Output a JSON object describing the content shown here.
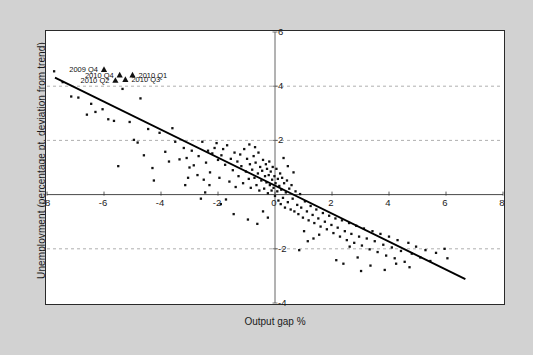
{
  "chart_data": {
    "type": "scatter",
    "title": "",
    "xlabel": "Output gap %",
    "ylabel": "Unemployment (percentage pt. deviation from trend)",
    "xlim": [
      -8,
      8
    ],
    "ylim": [
      -4,
      6
    ],
    "xticks": [
      "-8",
      "-6",
      "-4",
      "-2",
      "0",
      "2",
      "4",
      "6",
      "8"
    ],
    "xtick_values": [
      -8,
      -6,
      -4,
      -2,
      0,
      2,
      4,
      6,
      8
    ],
    "yticks": [
      "6",
      "4",
      "2",
      "-2",
      "-4"
    ],
    "ytick_values": [
      6,
      4,
      2,
      -2,
      -4
    ],
    "grid": "horizontal dashed at y = 4, 2, -2; solid axes at x = 0 and y = 0",
    "gridlines_y": [
      4,
      2,
      -2
    ],
    "axis_lines": {
      "x_zero": 0,
      "y_zero": 0
    },
    "legend": "none",
    "marker_style": "small black square",
    "fit_line": {
      "label": "linear trend line",
      "x1": -7.72,
      "y1": 4.32,
      "x2": 6.68,
      "y2": -3.12,
      "color": "#000000"
    },
    "points": [
      [
        -7.75,
        4.55
      ],
      [
        -7.45,
        4.15
      ],
      [
        -7.15,
        3.62
      ],
      [
        -6.9,
        3.58
      ],
      [
        -6.45,
        3.35
      ],
      [
        -6.3,
        3.05
      ],
      [
        -6.05,
        3.15
      ],
      [
        -5.85,
        2.78
      ],
      [
        -5.65,
        2.72
      ],
      [
        -5.35,
        3.9
      ],
      [
        -5.1,
        2.68
      ],
      [
        -4.95,
        2.02
      ],
      [
        -4.82,
        1.92
      ],
      [
        -4.72,
        3.55
      ],
      [
        -4.6,
        1.45
      ],
      [
        -4.45,
        2.42
      ],
      [
        -4.3,
        0.98
      ],
      [
        -4.05,
        2.28
      ],
      [
        -3.85,
        1.58
      ],
      [
        -3.72,
        1.22
      ],
      [
        -3.6,
        2.45
      ],
      [
        -3.5,
        1.95
      ],
      [
        -3.35,
        1.3
      ],
      [
        -3.2,
        1.72
      ],
      [
        -3.1,
        1.35
      ],
      [
        -3.0,
        1.0
      ],
      [
        -2.92,
        1.62
      ],
      [
        -2.85,
        1.08
      ],
      [
        -2.72,
        0.72
      ],
      [
        -2.68,
        1.42
      ],
      [
        -2.55,
        1.95
      ],
      [
        -2.5,
        0.55
      ],
      [
        -2.42,
        1.18
      ],
      [
        -2.35,
        1.62
      ],
      [
        -2.28,
        0.82
      ],
      [
        -2.2,
        1.52
      ],
      [
        -2.12,
        1.72
      ],
      [
        -2.05,
        1.9
      ],
      [
        -2.0,
        1.28
      ],
      [
        -1.95,
        0.62
      ],
      [
        -1.88,
        1.45
      ],
      [
        -1.82,
        1.68
      ],
      [
        -1.75,
        1.1
      ],
      [
        -1.68,
        1.82
      ],
      [
        -1.6,
        0.48
      ],
      [
        -1.55,
        1.32
      ],
      [
        -1.48,
        0.9
      ],
      [
        -1.42,
        1.55
      ],
      [
        -1.38,
        0.28
      ],
      [
        -1.32,
        1.22
      ],
      [
        -1.28,
        0.68
      ],
      [
        -1.22,
        1.48
      ],
      [
        -1.18,
        1.05
      ],
      [
        -1.12,
        0.42
      ],
      [
        -1.08,
        1.68
      ],
      [
        -1.02,
        0.85
      ],
      [
        -0.98,
        1.32
      ],
      [
        -0.92,
        0.58
      ],
      [
        -0.88,
        1.12
      ],
      [
        -0.85,
        0.25
      ],
      [
        -0.8,
        0.92
      ],
      [
        -0.75,
        1.42
      ],
      [
        -0.72,
        0.62
      ],
      [
        -0.68,
        1.18
      ],
      [
        -0.65,
        0.35
      ],
      [
        -0.6,
        0.78
      ],
      [
        -0.58,
        1.55
      ],
      [
        -0.55,
        0.15
      ],
      [
        -0.52,
        1.02
      ],
      [
        -0.48,
        0.52
      ],
      [
        -0.45,
        0.88
      ],
      [
        -0.42,
        1.28
      ],
      [
        -0.38,
        0.22
      ],
      [
        -0.35,
        0.68
      ],
      [
        -0.32,
        1.12
      ],
      [
        -0.3,
        0.45
      ],
      [
        -0.28,
        0.95
      ],
      [
        -0.25,
        0.05
      ],
      [
        -0.22,
        0.72
      ],
      [
        -0.2,
        1.22
      ],
      [
        -0.18,
        0.35
      ],
      [
        -0.15,
        0.85
      ],
      [
        -0.12,
        0.15
      ],
      [
        -0.1,
        0.55
      ],
      [
        -0.08,
        1.02
      ],
      [
        -0.05,
        0.25
      ],
      [
        -0.02,
        0.68
      ],
      [
        0.0,
        -0.05
      ],
      [
        0.02,
        0.42
      ],
      [
        0.05,
        0.95
      ],
      [
        0.08,
        0.12
      ],
      [
        0.1,
        0.58
      ],
      [
        0.12,
        -0.22
      ],
      [
        0.15,
        0.32
      ],
      [
        0.18,
        0.78
      ],
      [
        0.2,
        -0.35
      ],
      [
        0.22,
        0.18
      ],
      [
        0.25,
        0.62
      ],
      [
        0.28,
        -0.12
      ],
      [
        0.32,
        0.42
      ],
      [
        0.35,
        -0.48
      ],
      [
        0.38,
        0.08
      ],
      [
        0.42,
        0.52
      ],
      [
        0.45,
        -0.28
      ],
      [
        0.5,
        0.22
      ],
      [
        0.55,
        -0.55
      ],
      [
        0.58,
        0.35
      ],
      [
        0.62,
        -0.15
      ],
      [
        0.68,
        -0.62
      ],
      [
        0.72,
        0.12
      ],
      [
        0.78,
        -0.38
      ],
      [
        0.82,
        -0.72
      ],
      [
        0.88,
        0.02
      ],
      [
        0.92,
        -0.48
      ],
      [
        0.98,
        -0.85
      ],
      [
        1.05,
        -0.25
      ],
      [
        1.12,
        -0.62
      ],
      [
        1.18,
        -0.95
      ],
      [
        1.25,
        -0.42
      ],
      [
        1.32,
        -0.75
      ],
      [
        1.38,
        -1.05
      ],
      [
        1.45,
        -0.55
      ],
      [
        1.52,
        -0.88
      ],
      [
        1.6,
        -1.18
      ],
      [
        1.68,
        -0.68
      ],
      [
        1.75,
        -1.0
      ],
      [
        1.82,
        -1.28
      ],
      [
        1.9,
        -0.78
      ],
      [
        1.98,
        -1.12
      ],
      [
        2.05,
        -1.42
      ],
      [
        2.12,
        -0.88
      ],
      [
        2.2,
        -1.22
      ],
      [
        2.28,
        -1.55
      ],
      [
        2.35,
        -0.95
      ],
      [
        2.45,
        -1.35
      ],
      [
        2.52,
        -1.68
      ],
      [
        2.6,
        -1.05
      ],
      [
        2.68,
        -1.45
      ],
      [
        2.78,
        -1.78
      ],
      [
        2.85,
        -1.15
      ],
      [
        2.95,
        -1.55
      ],
      [
        3.05,
        -1.88
      ],
      [
        3.12,
        -1.25
      ],
      [
        3.22,
        -1.62
      ],
      [
        3.32,
        -2.02
      ],
      [
        3.42,
        -1.35
      ],
      [
        3.5,
        -1.72
      ],
      [
        3.6,
        -2.12
      ],
      [
        3.7,
        -1.45
      ],
      [
        3.8,
        -1.85
      ],
      [
        3.9,
        -2.25
      ],
      [
        4.0,
        -1.55
      ],
      [
        4.1,
        -1.95
      ],
      [
        4.2,
        -2.35
      ],
      [
        4.3,
        -1.68
      ],
      [
        4.42,
        -2.08
      ],
      [
        4.55,
        -2.48
      ],
      [
        4.68,
        -1.78
      ],
      [
        4.8,
        -2.18
      ],
      [
        4.95,
        -1.92
      ],
      [
        5.1,
        -2.32
      ],
      [
        5.28,
        -2.05
      ],
      [
        5.45,
        -2.45
      ],
      [
        5.65,
        -2.15
      ],
      [
        5.95,
        -2.0
      ],
      [
        6.05,
        -2.35
      ],
      [
        -2.6,
        -0.15
      ],
      [
        -1.9,
        -0.35
      ],
      [
        -1.45,
        -0.72
      ],
      [
        -0.95,
        -0.92
      ],
      [
        -0.62,
        -1.08
      ],
      [
        -0.42,
        -0.62
      ],
      [
        -0.25,
        -0.85
      ],
      [
        -3.15,
        0.35
      ],
      [
        -2.45,
        0.08
      ],
      [
        -1.72,
        -0.18
      ],
      [
        -4.25,
        0.52
      ],
      [
        -3.05,
        0.62
      ],
      [
        0.85,
        -2.05
      ],
      [
        1.15,
        -1.72
      ],
      [
        2.4,
        -2.55
      ],
      [
        2.9,
        -2.32
      ],
      [
        3.35,
        -2.62
      ],
      [
        3.85,
        -2.78
      ],
      [
        4.25,
        -2.55
      ],
      [
        4.72,
        -2.68
      ],
      [
        2.15,
        -2.42
      ],
      [
        3.02,
        -2.82
      ],
      [
        1.55,
        -1.48
      ],
      [
        2.62,
        -1.92
      ],
      [
        -0.7,
        1.75
      ],
      [
        0.45,
        1.05
      ],
      [
        0.3,
        1.35
      ],
      [
        0.65,
        0.82
      ],
      [
        -5.5,
        1.05
      ],
      [
        -6.6,
        2.95
      ],
      [
        -2.3,
        0.35
      ],
      [
        -0.9,
        1.85
      ],
      [
        1.02,
        -1.35
      ],
      [
        1.35,
        -1.62
      ]
    ],
    "annotations": [
      {
        "label": "2009 Q4",
        "x": -6.0,
        "y": 4.62,
        "label_side": "left"
      },
      {
        "label": "2010 Q4",
        "x": -5.45,
        "y": 4.42,
        "label_side": "left"
      },
      {
        "label": "2010 Q1",
        "x": -5.0,
        "y": 4.42,
        "label_side": "right"
      },
      {
        "label": "2010 Q2",
        "x": -5.6,
        "y": 4.22,
        "label_side": "left"
      },
      {
        "label": "2010 Q3",
        "x": -5.25,
        "y": 4.25,
        "label_side": "right"
      }
    ],
    "annotation_marker": "triangle"
  }
}
